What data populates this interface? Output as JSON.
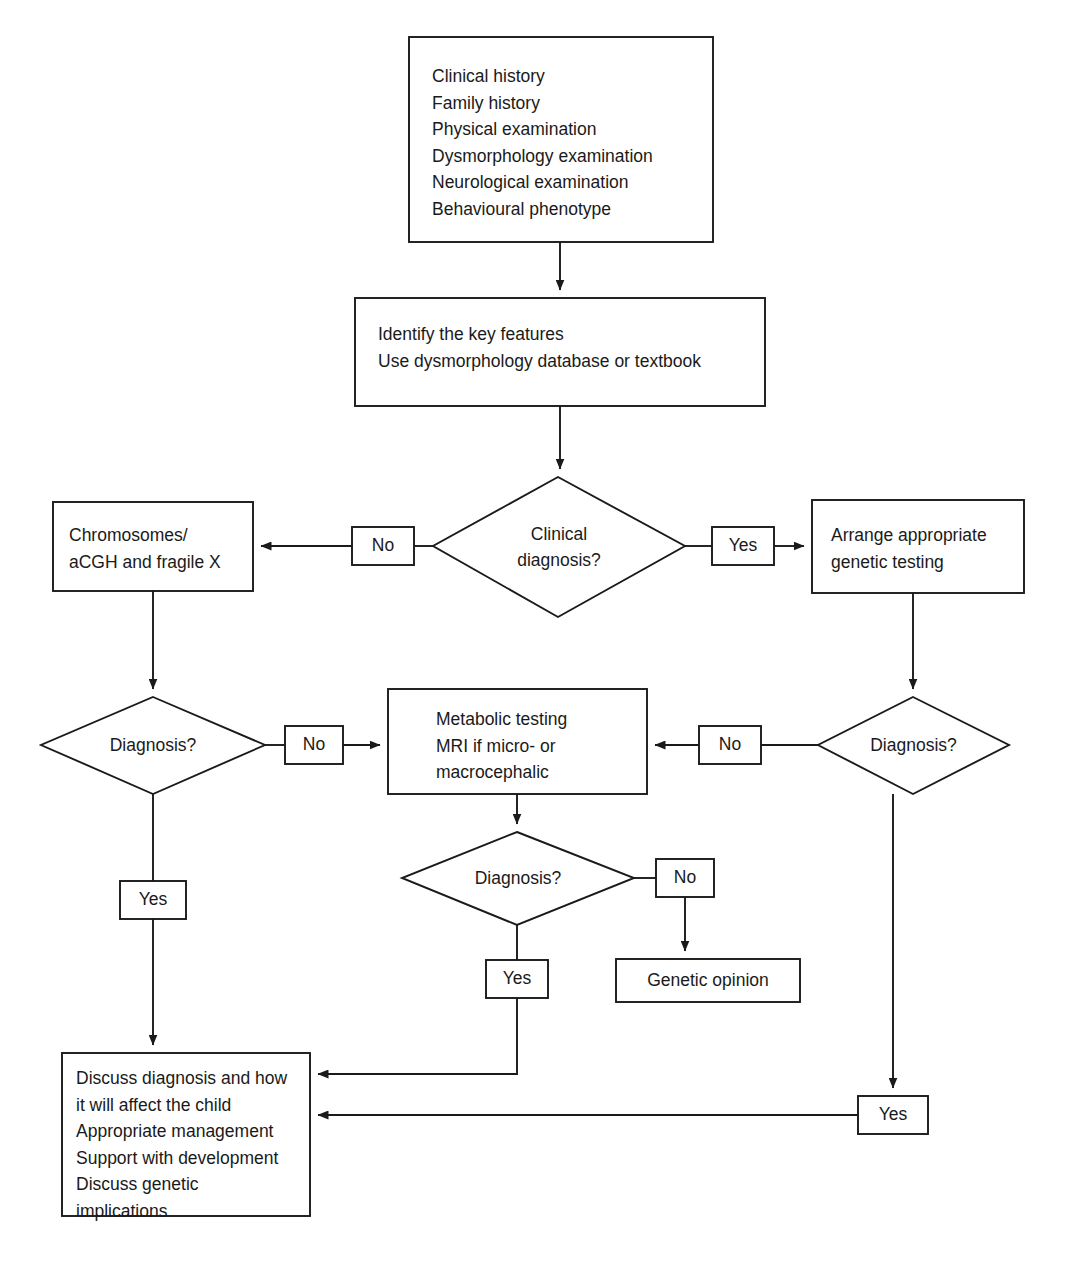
{
  "diagram": {
    "background_color": "#ffffff",
    "line_color": "#1a1a1a",
    "text_color": "#1a1a1a"
  },
  "nodes": {
    "initial_assessment": {
      "type": "process",
      "text": "Clinical history\nFamily history\nPhysical examination\nDysmorphology examination\nNeurological examination\nBehavioural phenotype"
    },
    "identify_features": {
      "type": "process",
      "text": "Identify the key features\nUse dysmorphology database or textbook"
    },
    "clinical_diagnosis_decision": {
      "type": "decision",
      "text": "Clinical\ndiagnosis?"
    },
    "chromosomes_box": {
      "type": "process",
      "text": "Chromosomes/\naCGH and fragile X"
    },
    "arrange_testing_box": {
      "type": "process",
      "text": "Arrange appropriate\ngenetic testing"
    },
    "diagnosis_decision_left": {
      "type": "decision",
      "text": "Diagnosis?"
    },
    "diagnosis_decision_right": {
      "type": "decision",
      "text": "Diagnosis?"
    },
    "metabolic_testing_box": {
      "type": "process",
      "text": "Metabolic testing\nMRI if micro- or\nmacrocephalic"
    },
    "diagnosis_decision_centre": {
      "type": "decision",
      "text": "Diagnosis?"
    },
    "genetic_opinion_box": {
      "type": "process",
      "text": "Genetic opinion"
    },
    "discuss_diagnosis_box": {
      "type": "process",
      "text": "Discuss diagnosis and how\nit will affect the child\nAppropriate management\nSupport with development\nDiscuss genetic\nimplications"
    }
  },
  "edge_labels": {
    "clinical_no": "No",
    "clinical_yes": "Yes",
    "left_diagnosis_no": "No",
    "left_diagnosis_yes": "Yes",
    "right_diagnosis_no": "No",
    "right_diagnosis_yes": "Yes",
    "centre_diagnosis_no": "No",
    "centre_diagnosis_yes": "Yes"
  }
}
